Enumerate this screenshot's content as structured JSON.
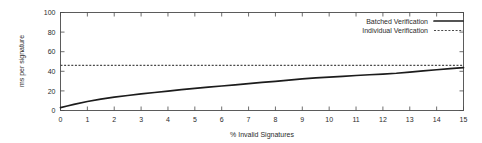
{
  "chart_data": {
    "type": "line",
    "title": "",
    "xlabel": "% Invalid Signatures",
    "ylabel": "ms per signature",
    "xlim": [
      0,
      15
    ],
    "ylim": [
      0,
      100
    ],
    "xticks": [
      "0",
      "1",
      "2",
      "3",
      "4",
      "5",
      "6",
      "7",
      "8",
      "9",
      "10",
      "11",
      "12",
      "13",
      "14",
      "15"
    ],
    "yticks": [
      "0",
      "20",
      "40",
      "60",
      "80",
      "100"
    ],
    "grid": false,
    "legend_position": "top-right",
    "frame": "box-with-inward-ticks",
    "series": [
      {
        "name": "Batched Verification",
        "style": "solid",
        "color": "#1c1c1c",
        "x": [
          0,
          0.25,
          0.5,
          1,
          1.5,
          2,
          2.5,
          3,
          3.5,
          4,
          4.5,
          5,
          5.5,
          6,
          6.5,
          7,
          7.5,
          8,
          8.5,
          9,
          9.5,
          10,
          10.5,
          11,
          11.5,
          12,
          12.5,
          13,
          13.5,
          14,
          14.5,
          15
        ],
        "values": [
          3,
          4.6,
          6.2,
          9.2,
          11.6,
          13.6,
          15.3,
          16.9,
          18.4,
          19.8,
          21.2,
          22.5,
          23.8,
          25.0,
          26.2,
          27.4,
          28.6,
          29.8,
          31.0,
          32.2,
          33.2,
          34.0,
          34.8,
          35.7,
          36.5,
          37.2,
          38.0,
          39.2,
          40.4,
          41.6,
          42.8,
          43.8
        ]
      },
      {
        "name": "Individual Verification",
        "style": "dotted",
        "color": "#4a4a4a",
        "x": [
          0,
          15
        ],
        "values": [
          46,
          46
        ]
      }
    ]
  },
  "legend": {
    "entries": [
      {
        "label": "Batched Verification",
        "style": "solid"
      },
      {
        "label": "Individual Verification",
        "style": "dotted"
      }
    ]
  }
}
